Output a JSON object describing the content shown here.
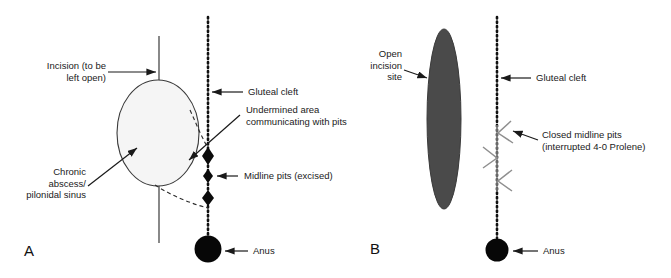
{
  "figure": {
    "background_color": "#ffffff",
    "ink_color": "#1a1a1a",
    "suture_color": "#8a8a8a",
    "incision_line_color": "#6b6b6b",
    "open_site_fill": "#4a4a4a",
    "abscess_fill": "#f4f4f4"
  },
  "panels": [
    {
      "letter": "A",
      "name": "panel-a",
      "labels": {
        "incision": "Incision (to be\nleft open)",
        "gluteal_cleft": "Gluteal cleft",
        "undermined_area": "Undermined area\ncommunicating with pits",
        "midline_pits": "Midline pits (excised)",
        "chronic_abscess": "Chronic\nabscess/\npilonidal sinus",
        "anus": "Anus"
      }
    },
    {
      "letter": "B",
      "name": "panel-b",
      "labels": {
        "open_incision_site": "Open\nincision\nsite",
        "gluteal_cleft": "Gluteal cleft",
        "closed_midline_pits": "Closed midline pits\n(interrupted 4-0 Prolene)",
        "anus": "Anus"
      }
    }
  ]
}
